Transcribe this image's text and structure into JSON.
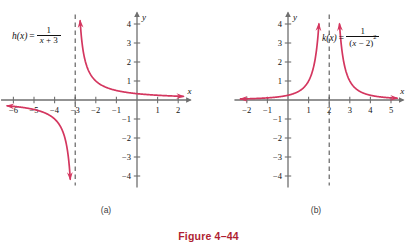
{
  "figure": {
    "caption": "Figure 4–44",
    "curve_color": "#d4365f",
    "axis_color": "#6f6f6f",
    "asymptote_color": "#555555",
    "caption_color": "#b01f33",
    "text_color": "#111111"
  },
  "panels": [
    {
      "id": "a",
      "sublabel": "(a)",
      "function_label": {
        "lhs": "h(x)",
        "equals": "=",
        "numerator": "1",
        "denominator_text": "x + 3",
        "denominator_var": "x",
        "denominator_rest": " + 3",
        "exponent": ""
      },
      "chart_data": {
        "type": "line",
        "title": "h(x) = 1/(x + 3)",
        "xlabel": "x",
        "ylabel": "y",
        "xlim": [
          -6.6,
          2.6
        ],
        "ylim": [
          -4.6,
          4.6
        ],
        "xticks": [
          -6,
          -5,
          -4,
          -3,
          -2,
          -1,
          1,
          2
        ],
        "yticks": [
          -4,
          -3,
          -2,
          -1,
          1,
          2,
          3,
          4
        ],
        "grid": false,
        "vertical_asymptote": -3,
        "horizontal_asymptote": 0,
        "branches": [
          {
            "name": "right branch",
            "x_start": -2.76,
            "x_end": 2.25,
            "arrow_start": true,
            "arrow_end": true,
            "note": "descends from y=4.2 near x=-3+ toward y=0 as x increases"
          },
          {
            "name": "left branch",
            "x_start": -6.3,
            "x_end": -3.24,
            "arrow_start": true,
            "arrow_end": true,
            "note": "rises from y=-4.3 near x=-3- toward y=0 as x decreases"
          }
        ]
      }
    },
    {
      "id": "b",
      "sublabel": "(b)",
      "function_label": {
        "lhs": "k(x)",
        "equals": "=",
        "numerator": "1",
        "denominator_text": "(x − 2)",
        "denominator_var": "x",
        "denominator_rest": " − 2",
        "exponent": "2"
      },
      "chart_data": {
        "type": "line",
        "title": "k(x) = 1/(x − 2)²",
        "xlabel": "x",
        "ylabel": "y",
        "xlim": [
          -2.6,
          5.6
        ],
        "ylim": [
          -4.6,
          4.6
        ],
        "xticks": [
          -2,
          -1,
          1,
          2,
          3,
          4,
          5
        ],
        "yticks": [
          -4,
          -3,
          -2,
          -1,
          1,
          2,
          3,
          4
        ],
        "grid": false,
        "vertical_asymptote": 2,
        "horizontal_asymptote": 0,
        "branches": [
          {
            "name": "left branch",
            "x_start": -2.3,
            "x_end": 1.5,
            "arrow_start": true,
            "arrow_end": true,
            "note": "rises from y=0 at far left to y=4.3 approaching x=2 from the left"
          },
          {
            "name": "right branch",
            "x_start": 2.5,
            "x_end": 5.3,
            "arrow_start": true,
            "arrow_end": true,
            "note": "falls from y=4.3 near x=2+ toward y=0 as x increases"
          }
        ]
      }
    }
  ]
}
